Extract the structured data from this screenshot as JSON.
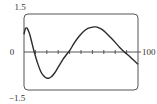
{
  "chart_data": {
    "type": "line",
    "title": "",
    "xlabel": "",
    "ylabel": "",
    "xlim": [
      0,
      100
    ],
    "ylim": [
      -1.5,
      1.5
    ],
    "x_tick_step": 10,
    "tick_labels": {
      "y_top": "1.5",
      "y_zero": "0",
      "y_bottom": "−1.5",
      "x_right": "100"
    },
    "grid": false,
    "legend": "none",
    "series": [
      {
        "name": "curve",
        "x": [
          0,
          1,
          2,
          3,
          5,
          7,
          9,
          12,
          15,
          18,
          20,
          22,
          24,
          27,
          30,
          34,
          37,
          40,
          44,
          48,
          52,
          56,
          60,
          62,
          64,
          68,
          72,
          76,
          80,
          84,
          88,
          92,
          96,
          100
        ],
        "y": [
          0.7,
          0.9,
          0.95,
          0.92,
          0.7,
          0.35,
          0.0,
          -0.45,
          -0.8,
          -0.98,
          -1.03,
          -1.03,
          -0.98,
          -0.82,
          -0.6,
          -0.3,
          -0.12,
          0.05,
          0.35,
          0.6,
          0.8,
          0.93,
          0.98,
          0.99,
          0.98,
          0.9,
          0.75,
          0.57,
          0.38,
          0.18,
          0.0,
          -0.15,
          -0.32,
          -0.48
        ]
      }
    ]
  }
}
